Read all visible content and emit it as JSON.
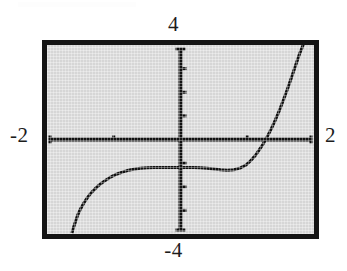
{
  "figure": {
    "kind": "graphing-calculator-screen",
    "frame": {
      "border_color": "#141414",
      "screen_color": "#d6d6d6"
    },
    "labels": {
      "y_max": "4",
      "y_min": "-4",
      "x_min": "-2",
      "x_max": "2"
    }
  },
  "chart_data": {
    "type": "line",
    "title": "",
    "subtitle": "",
    "xlabel": "",
    "ylabel": "",
    "xlim": [
      -2,
      2
    ],
    "ylim": [
      -4,
      4
    ],
    "grid": false,
    "legend": null,
    "axes": {
      "x_axis_drawn": true,
      "y_axis_drawn": true,
      "x_tick_spacing": 1,
      "y_tick_spacing": 1,
      "x_ticks": [
        -1,
        1
      ],
      "y_ticks": [
        -3,
        -2,
        -1,
        1,
        2,
        3
      ],
      "tick_style": "small-marks-on-axis"
    },
    "series": [
      {
        "name": "curve",
        "color": "#111111",
        "line_width": 3,
        "x": [
          -1.62,
          -1.6,
          -1.57,
          -1.54,
          -1.5,
          -1.45,
          -1.4,
          -1.34,
          -1.27,
          -1.2,
          -1.12,
          -1.04,
          -0.95,
          -0.86,
          -0.78,
          -0.7,
          -0.6,
          -0.5,
          -0.4,
          -0.3,
          -0.2,
          -0.1,
          0.0,
          0.1,
          0.2,
          0.3,
          0.4,
          0.5,
          0.6,
          0.7,
          0.8,
          0.9,
          0.98,
          1.05,
          1.12,
          1.18,
          1.24,
          1.3,
          1.36,
          1.42,
          1.48,
          1.54,
          1.6,
          1.66,
          1.72,
          1.78,
          1.83
        ],
        "y": [
          -3.9,
          -3.7,
          -3.45,
          -3.2,
          -2.95,
          -2.7,
          -2.48,
          -2.26,
          -2.06,
          -1.88,
          -1.72,
          -1.58,
          -1.46,
          -1.37,
          -1.3,
          -1.26,
          -1.22,
          -1.2,
          -1.19,
          -1.18,
          -1.18,
          -1.18,
          -1.18,
          -1.18,
          -1.19,
          -1.2,
          -1.22,
          -1.25,
          -1.28,
          -1.3,
          -1.28,
          -1.2,
          -1.08,
          -0.9,
          -0.68,
          -0.44,
          -0.18,
          0.12,
          0.45,
          0.82,
          1.22,
          1.66,
          2.12,
          2.6,
          3.1,
          3.6,
          3.95
        ]
      }
    ],
    "annotations": [
      {
        "text": "4",
        "position": "above-top-center"
      },
      {
        "text": "-4",
        "position": "below-bottom-center"
      },
      {
        "text": "-2",
        "position": "left-of-x-axis"
      },
      {
        "text": "2",
        "position": "right-of-x-axis"
      }
    ]
  }
}
